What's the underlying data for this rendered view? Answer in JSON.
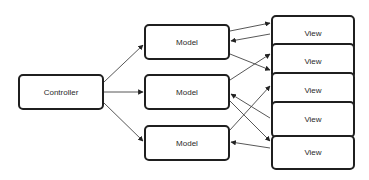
{
  "diagram": {
    "title": "",
    "nodes": {
      "controller": {
        "label": "Controller",
        "x": 18,
        "y": 74,
        "w": 86,
        "h": 36
      },
      "models": [
        {
          "label": "Model",
          "x": 144,
          "y": 24,
          "w": 86,
          "h": 36
        },
        {
          "label": "Model",
          "x": 144,
          "y": 74,
          "w": 86,
          "h": 36
        },
        {
          "label": "Model",
          "x": 144,
          "y": 125,
          "w": 86,
          "h": 36
        }
      ],
      "views": [
        {
          "label": "View",
          "x": 271,
          "y": 15,
          "w": 84,
          "h": 36
        },
        {
          "label": "View",
          "x": 271,
          "y": 43,
          "w": 84,
          "h": 36
        },
        {
          "label": "View",
          "x": 271,
          "y": 72,
          "w": 84,
          "h": 37
        },
        {
          "label": "View",
          "x": 271,
          "y": 101,
          "w": 84,
          "h": 37
        },
        {
          "label": "View",
          "x": 271,
          "y": 135,
          "w": 84,
          "h": 35
        }
      ]
    },
    "edges": [
      {
        "from": "controller",
        "to": "model-1",
        "x1": 104,
        "y1": 82,
        "x2": 143,
        "y2": 45
      },
      {
        "from": "controller",
        "to": "model-2",
        "x1": 104,
        "y1": 92,
        "x2": 143,
        "y2": 92
      },
      {
        "from": "controller",
        "to": "model-3",
        "x1": 104,
        "y1": 103,
        "x2": 143,
        "y2": 141
      },
      {
        "from": "model-1",
        "to": "view-1",
        "x1": 230,
        "y1": 31,
        "x2": 270,
        "y2": 23
      },
      {
        "from": "view-1",
        "to": "model-1",
        "x1": 270,
        "y1": 34,
        "x2": 231,
        "y2": 41
      },
      {
        "from": "model-1",
        "to": "view-2",
        "x1": 230,
        "y1": 54,
        "x2": 270,
        "y2": 70
      },
      {
        "from": "model-2",
        "to": "view-2",
        "x1": 230,
        "y1": 80,
        "x2": 270,
        "y2": 54
      },
      {
        "from": "view-4",
        "to": "model-2",
        "x1": 270,
        "y1": 118,
        "x2": 231,
        "y2": 94
      },
      {
        "from": "model-2",
        "to": "view-5",
        "x1": 230,
        "y1": 101,
        "x2": 270,
        "y2": 141
      },
      {
        "from": "model-3",
        "to": "view-3",
        "x1": 230,
        "y1": 130,
        "x2": 270,
        "y2": 86
      },
      {
        "from": "view-5",
        "to": "model-3",
        "x1": 270,
        "y1": 148,
        "x2": 231,
        "y2": 142
      }
    ],
    "colors": {
      "stroke": "#1f1f1f",
      "edge": "#444444",
      "text": "#2a2a2a",
      "background": "#ffffff"
    }
  }
}
